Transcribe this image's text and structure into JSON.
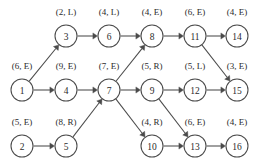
{
  "figure": {
    "kind": "directed-acyclic-graph",
    "node_radius": 11,
    "ink_color": "#4a4a4a",
    "text_color": "#2b2b2b",
    "background": "#ffffff"
  },
  "nodes": [
    {
      "id": "1",
      "label": "(6, E)",
      "cx": 22,
      "cy": 90,
      "lx": 22,
      "ly": 69
    },
    {
      "id": "2",
      "label": "(5, E)",
      "cx": 22,
      "cy": 146,
      "lx": 22,
      "ly": 125
    },
    {
      "id": "3",
      "label": "(2, L)",
      "cx": 66,
      "cy": 36,
      "lx": 66,
      "ly": 15
    },
    {
      "id": "4",
      "label": "(9, E)",
      "cx": 66,
      "cy": 90,
      "lx": 66,
      "ly": 69
    },
    {
      "id": "5",
      "label": "(8, R)",
      "cx": 66,
      "cy": 146,
      "lx": 66,
      "ly": 125
    },
    {
      "id": "6",
      "label": "(4, L)",
      "cx": 109,
      "cy": 36,
      "lx": 109,
      "ly": 15
    },
    {
      "id": "7",
      "label": "(7, E)",
      "cx": 109,
      "cy": 90,
      "lx": 109,
      "ly": 69
    },
    {
      "id": "8",
      "label": "(4, E)",
      "cx": 152,
      "cy": 36,
      "lx": 152,
      "ly": 15
    },
    {
      "id": "9",
      "label": "(5, R)",
      "cx": 152,
      "cy": 90,
      "lx": 152,
      "ly": 69
    },
    {
      "id": "10",
      "label": "(4, R)",
      "cx": 152,
      "cy": 146,
      "lx": 152,
      "ly": 125
    },
    {
      "id": "11",
      "label": "(6, E)",
      "cx": 195,
      "cy": 36,
      "lx": 195,
      "ly": 15
    },
    {
      "id": "12",
      "label": "(5, L)",
      "cx": 195,
      "cy": 90,
      "lx": 195,
      "ly": 69
    },
    {
      "id": "13",
      "label": "(6, E)",
      "cx": 195,
      "cy": 146,
      "lx": 195,
      "ly": 125
    },
    {
      "id": "14",
      "label": "(4, E)",
      "cx": 237,
      "cy": 36,
      "lx": 237,
      "ly": 15
    },
    {
      "id": "15",
      "label": "(3, E)",
      "cx": 237,
      "cy": 90,
      "lx": 237,
      "ly": 69
    },
    {
      "id": "16",
      "label": "(4, E)",
      "cx": 237,
      "cy": 146,
      "lx": 237,
      "ly": 125
    }
  ],
  "edges": [
    {
      "from": "1",
      "to": "3"
    },
    {
      "from": "1",
      "to": "4"
    },
    {
      "from": "2",
      "to": "5"
    },
    {
      "from": "3",
      "to": "6"
    },
    {
      "from": "4",
      "to": "7"
    },
    {
      "from": "5",
      "to": "7"
    },
    {
      "from": "6",
      "to": "8"
    },
    {
      "from": "7",
      "to": "8"
    },
    {
      "from": "7",
      "to": "9"
    },
    {
      "from": "7",
      "to": "10"
    },
    {
      "from": "8",
      "to": "11"
    },
    {
      "from": "9",
      "to": "12"
    },
    {
      "from": "9",
      "to": "13"
    },
    {
      "from": "10",
      "to": "13"
    },
    {
      "from": "11",
      "to": "14"
    },
    {
      "from": "11",
      "to": "15"
    },
    {
      "from": "12",
      "to": "15"
    },
    {
      "from": "13",
      "to": "16"
    }
  ]
}
